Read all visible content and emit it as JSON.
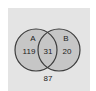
{
  "diagram": {
    "type": "venn",
    "sets": [
      {
        "name": "A",
        "only_count": "119"
      },
      {
        "name": "B",
        "only_count": "20"
      }
    ],
    "intersection_count": "31",
    "outside_count": "87",
    "colors": {
      "page_background": "#ffffff",
      "universe_background": "#e4e4e4",
      "circle_fill": "#c6c6c6",
      "circle_stroke": "#3c3c3c",
      "text": "#222222"
    }
  }
}
